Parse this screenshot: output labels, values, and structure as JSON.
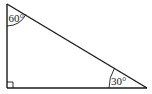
{
  "diagram": {
    "type": "right-triangle",
    "angles": {
      "top": "60°",
      "bottom_right": "30°",
      "bottom_left": "right-angle"
    },
    "stroke_color": "#1a1a1a",
    "background": "#ffffff"
  }
}
